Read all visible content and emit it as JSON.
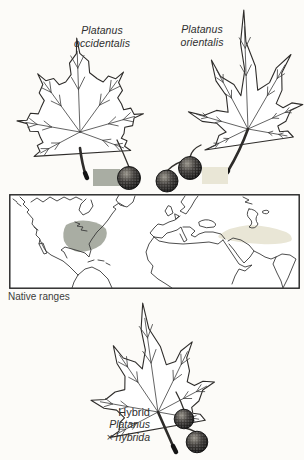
{
  "colors": {
    "ink": "#2e2c2a",
    "paper": "#fcfbf8",
    "occidentalis_range": "#a9ada3",
    "orientalis_range": "#e9e6d6",
    "text": "#2f2f2f"
  },
  "top_left": {
    "name_line1": "Platanus",
    "name_line2": "occidentalis",
    "swatch_color": "#a9ada3",
    "seed_ball_count": 1
  },
  "top_right": {
    "name_line1": "Platanus",
    "name_line2": "orientalis",
    "swatch_color": "#e9e6d6",
    "seed_ball_count": 2
  },
  "map": {
    "caption": "Native ranges"
  },
  "bottom": {
    "heading": "Hybrid",
    "name_line1": "Platanus",
    "name_line2": "× hybrida",
    "seed_ball_count": 2
  }
}
